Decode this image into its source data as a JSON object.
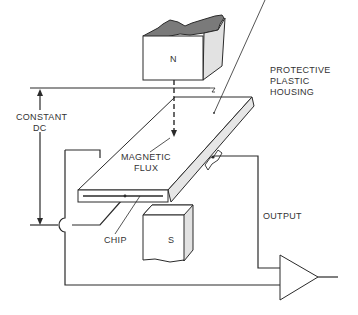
{
  "diagram": {
    "labels": {
      "north_pole": "N",
      "south_pole": "S",
      "constant_dc_line1": "CONSTANT",
      "constant_dc_line2": "DC",
      "magnetic_flux_line1": "MAGNETIC",
      "magnetic_flux_line2": "FLUX",
      "housing_line1": "PROTECTIVE",
      "housing_line2": "PLASTIC",
      "housing_line3": "HOUSING",
      "chip": "CHIP",
      "output": "OUTPUT"
    },
    "colors": {
      "line": "#2a2a2a",
      "text": "#333333",
      "magnet_top": "#7a7a7a",
      "magnet_side": "#e2e2e2",
      "housing_edge": "#e6e6e6",
      "background": "#ffffff"
    }
  }
}
